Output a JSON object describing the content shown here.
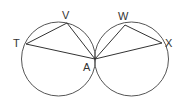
{
  "diagram": {
    "title": "",
    "stroke_color": "#555555",
    "circles": [
      {
        "name": "left-circle",
        "cx": 58.5,
        "cy": 59,
        "r": 37
      },
      {
        "name": "right-circle",
        "cx": 131.5,
        "cy": 59,
        "r": 37
      }
    ],
    "points": {
      "T": {
        "label": "T",
        "x": 26,
        "y": 44,
        "lx": 13,
        "ly": 47
      },
      "V": {
        "label": "V",
        "x": 67,
        "y": 23,
        "lx": 62,
        "ly": 19
      },
      "A": {
        "label": "A",
        "x": 95,
        "y": 59,
        "lx": 83,
        "ly": 71
      },
      "W": {
        "label": "W",
        "x": 125,
        "y": 25,
        "lx": 118,
        "ly": 20
      },
      "X": {
        "label": "X",
        "x": 162,
        "y": 43,
        "lx": 165,
        "ly": 47
      }
    },
    "segments": [
      [
        "T",
        "V"
      ],
      [
        "V",
        "A"
      ],
      [
        "T",
        "A"
      ],
      [
        "A",
        "W"
      ],
      [
        "W",
        "X"
      ],
      [
        "A",
        "X"
      ]
    ]
  }
}
